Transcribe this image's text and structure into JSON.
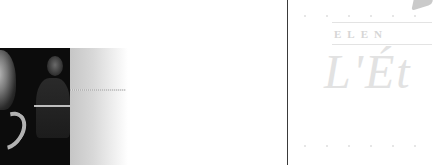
{
  "left_section": {
    "image": {
      "alt": "portrait-photo",
      "description": "dark monochrome photo of a bald man and a woman in the background",
      "fade_color_start": "#c6c6c6",
      "fade_color_end": "#ffffff"
    }
  },
  "right_panel": {
    "border_color": "#3a3a3a",
    "watermark": {
      "caps_text": "ELEN",
      "script_text": "L'Ét",
      "color": "#d6d6d6"
    }
  }
}
